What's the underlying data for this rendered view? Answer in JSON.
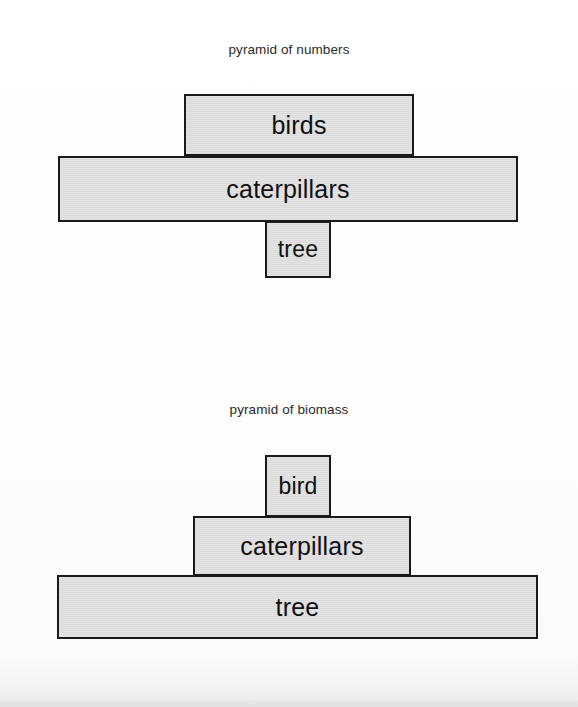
{
  "figures": [
    {
      "title": "pyramid of numbers",
      "tiers": [
        {
          "label": "birds",
          "level": "top"
        },
        {
          "label": "caterpillars",
          "level": "middle"
        },
        {
          "label": "tree",
          "level": "bottom"
        }
      ]
    },
    {
      "title": "pyramid of biomass",
      "tiers": [
        {
          "label": "bird",
          "level": "top"
        },
        {
          "label": "caterpillars",
          "level": "middle"
        },
        {
          "label": "tree",
          "level": "bottom"
        }
      ]
    }
  ],
  "chart_data": [
    {
      "type": "bar",
      "title": "pyramid of numbers",
      "xlabel": "",
      "ylabel": "",
      "orientation": "horizontal-centered-pyramid",
      "categories": [
        "tree",
        "caterpillars",
        "birds"
      ],
      "values": [
        66,
        460,
        230
      ],
      "value_units": "relative bar width (px)",
      "bar_order_bottom_to_top": [
        "tree",
        "caterpillars",
        "birds"
      ],
      "grid": false,
      "legend": false,
      "notes": "Inverted pyramid: one tree supports many caterpillars which support fewer birds."
    },
    {
      "type": "bar",
      "title": "pyramid of biomass",
      "xlabel": "",
      "ylabel": "",
      "orientation": "horizontal-centered-pyramid",
      "categories": [
        "tree",
        "caterpillars",
        "bird"
      ],
      "values": [
        481,
        218,
        66
      ],
      "value_units": "relative bar width (px)",
      "bar_order_bottom_to_top": [
        "tree",
        "caterpillars",
        "bird"
      ],
      "grid": false,
      "legend": false,
      "notes": "Upright pyramid: tree biomass exceeds caterpillar biomass which exceeds bird biomass."
    }
  ],
  "style": {
    "box_fill": "#e0e0e0",
    "box_border": "#1a1a1a",
    "background": "#fdfdfd",
    "text_color": "#101010"
  }
}
